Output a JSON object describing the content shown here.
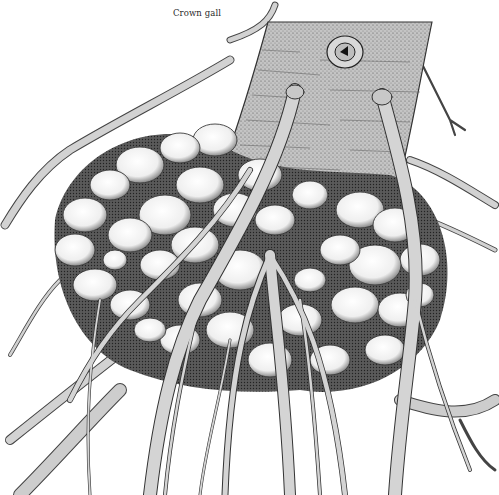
{
  "figure": {
    "label": "Crown gall",
    "colors": {
      "background": "#ffffff",
      "ink": "#2a2a2a",
      "trunk_fill": "#b9b9b9",
      "root_fill": "#cfcfcf",
      "gall_fill": "#f4f4f4",
      "gall_shadow": "#3a3a3a"
    }
  }
}
